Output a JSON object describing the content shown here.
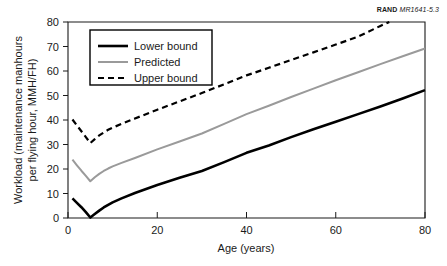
{
  "source_tag": {
    "org": "RAND",
    "id": "MR1641-5.3"
  },
  "chart_data": {
    "type": "line",
    "title": "",
    "xlabel": "Age (years)",
    "ylabel": "Workload (maintenance manhours per flying hour, MMH/FH)",
    "ylabel_line1": "Workload (maintenance manhours",
    "ylabel_line2": "per flying hour, MMH/FH)",
    "xlim": [
      0,
      80
    ],
    "ylim": [
      0,
      80
    ],
    "xticks": [
      0,
      20,
      40,
      60,
      80
    ],
    "yticks": [
      0,
      10,
      20,
      30,
      40,
      50,
      60,
      70,
      80
    ],
    "xticklabels": [
      "0",
      "20",
      "40",
      "60",
      "80"
    ],
    "yticklabels": [
      "0",
      "10",
      "20",
      "30",
      "40",
      "50",
      "60",
      "70",
      "80"
    ],
    "grid": false,
    "legend_position": "upper-left-inside",
    "series": [
      {
        "name": "Lower bound",
        "style": "solid",
        "color": "#000000",
        "width": 2.6,
        "x": [
          1,
          2,
          3,
          4,
          5,
          6,
          7,
          8,
          9,
          10,
          12,
          15,
          20,
          25,
          30,
          35,
          40,
          45,
          50,
          55,
          60,
          65,
          70,
          75,
          80
        ],
        "y": [
          8.0,
          6.2,
          4.4,
          2.4,
          0.2,
          1.6,
          3.0,
          4.3,
          5.4,
          6.4,
          8.0,
          10.2,
          13.5,
          16.4,
          19.2,
          22.8,
          26.6,
          29.6,
          33.0,
          36.2,
          39.3,
          42.4,
          45.5,
          48.8,
          52.2
        ]
      },
      {
        "name": "Predicted",
        "style": "solid",
        "color": "#9a9a9a",
        "width": 2.0,
        "x": [
          1,
          2,
          3,
          4,
          5,
          6,
          7,
          8,
          9,
          10,
          12,
          15,
          20,
          25,
          30,
          35,
          40,
          45,
          50,
          55,
          60,
          65,
          70,
          75,
          80
        ],
        "y": [
          23.8,
          21.5,
          19.3,
          17.2,
          15.0,
          16.6,
          18.0,
          19.2,
          20.2,
          21.1,
          22.5,
          24.5,
          28.0,
          31.2,
          34.5,
          38.4,
          42.4,
          45.8,
          49.4,
          52.8,
          56.2,
          59.5,
          62.8,
          66.0,
          69.2
        ]
      },
      {
        "name": "Upper bound",
        "style": "dashed",
        "color": "#000000",
        "width": 2.2,
        "x": [
          1,
          2,
          3,
          4,
          5,
          6,
          7,
          8,
          9,
          10,
          12,
          15,
          20,
          25,
          30,
          35,
          40,
          45,
          50,
          55,
          60,
          65,
          70,
          72
        ],
        "y": [
          40.2,
          37.8,
          35.4,
          33.0,
          30.6,
          32.2,
          33.7,
          34.9,
          36.0,
          36.9,
          38.4,
          40.6,
          44.2,
          47.6,
          51.0,
          54.6,
          58.2,
          61.3,
          64.5,
          67.6,
          70.8,
          74.0,
          78.4,
          80.0
        ]
      }
    ]
  }
}
